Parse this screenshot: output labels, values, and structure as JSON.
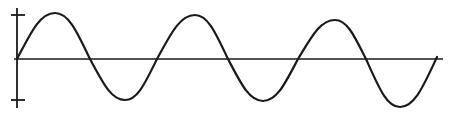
{
  "diagram": {
    "title": "",
    "type": "sine-wave",
    "stroke_color": "#1a1a1a",
    "background": "#ffffff",
    "cycles_shown": 3,
    "axes": {
      "vertical": {
        "x": 17,
        "y_top": 8,
        "y_bottom": 108,
        "ticks": [
          {
            "y": 15,
            "label": ""
          },
          {
            "y": 100,
            "label": ""
          }
        ]
      },
      "horizontal": {
        "y": 59,
        "x_start": 14,
        "x_end": 443
      }
    },
    "wave_points": [
      {
        "x": 17,
        "y": 59
      },
      {
        "x": 55,
        "y": 13
      },
      {
        "x": 90,
        "y": 59
      },
      {
        "x": 125,
        "y": 100
      },
      {
        "x": 157,
        "y": 59
      },
      {
        "x": 195,
        "y": 15
      },
      {
        "x": 228,
        "y": 59
      },
      {
        "x": 263,
        "y": 101
      },
      {
        "x": 298,
        "y": 59
      },
      {
        "x": 335,
        "y": 20
      },
      {
        "x": 366,
        "y": 59
      },
      {
        "x": 400,
        "y": 107
      },
      {
        "x": 437,
        "y": 57
      }
    ]
  }
}
